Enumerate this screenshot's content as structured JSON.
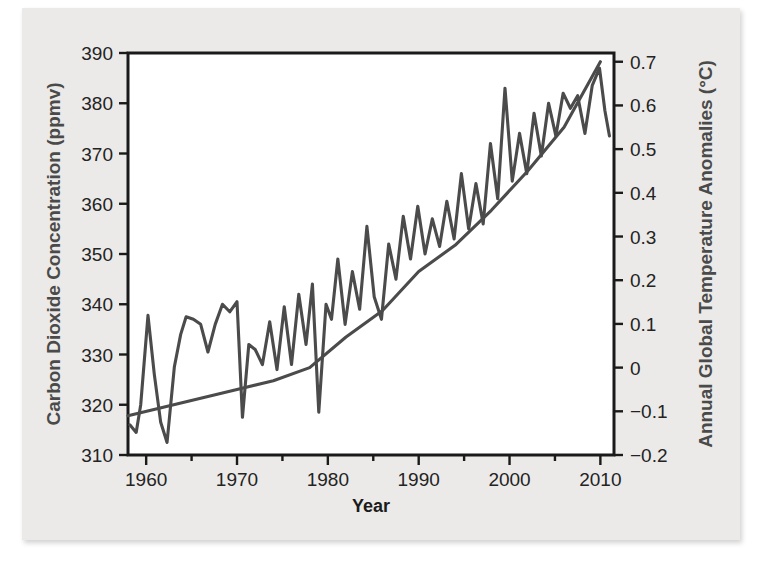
{
  "figure": {
    "background_color": "#ebeae8",
    "plot_background_color": "#ffffff",
    "line_color": "#4b4b4b",
    "axis_color": "#1a1a1a",
    "axis_title_color": "#4a4a4a"
  },
  "chart_data": {
    "type": "line",
    "title": "",
    "xlabel": "Year",
    "ylabel": "Carbon Dioxide Concentration (ppmv)",
    "y2label": "Annual Global Temperature Anomalies (°C)",
    "xlim": [
      1958,
      2011.5
    ],
    "ylim": [
      310,
      390
    ],
    "y2lim": [
      -0.2,
      0.72
    ],
    "grid": false,
    "legend": null,
    "xticks": [
      1960,
      1970,
      1980,
      1990,
      2000,
      2010
    ],
    "xtick_labels": [
      "1960",
      "1970",
      "1980",
      "1990",
      "2000",
      "2010"
    ],
    "xminor_ticks": [
      1965,
      1975,
      1985,
      1995,
      2005
    ],
    "yticks": [
      310,
      320,
      330,
      340,
      350,
      360,
      370,
      380,
      390
    ],
    "ytick_labels": [
      "310",
      "320",
      "330",
      "340",
      "350",
      "360",
      "370",
      "380",
      "390"
    ],
    "y2ticks": [
      -0.2,
      -0.1,
      0,
      0.1,
      0.2,
      0.3,
      0.4,
      0.5,
      0.6,
      0.7
    ],
    "y2tick_labels": [
      "−0.2",
      "−0.1",
      "0",
      "0.1",
      "0.2",
      "0.3",
      "0.4",
      "0.5",
      "0.6",
      "0.7"
    ],
    "series": [
      {
        "name": "Carbon Dioxide Concentration",
        "axis": "left",
        "units": "ppmv",
        "x": [
          1958.2,
          1958.9,
          1959.4,
          1960.2,
          1960.9,
          1961.6,
          1962.3,
          1963.1,
          1963.8,
          1964.4,
          1965.2,
          1966.0,
          1966.8,
          1967.6,
          1968.4,
          1969.2,
          1970.0,
          1970.6,
          1971.3,
          1972.0,
          1972.8,
          1973.6,
          1974.4,
          1975.2,
          1976.0,
          1976.8,
          1977.6,
          1978.3,
          1979.0,
          1979.8,
          1980.4,
          1981.1,
          1981.9,
          1982.7,
          1983.5,
          1984.3,
          1985.1,
          1985.9,
          1986.7,
          1987.5,
          1988.3,
          1989.1,
          1989.9,
          1990.7,
          1991.5,
          1992.3,
          1993.1,
          1993.9,
          1994.7,
          1995.5,
          1996.3,
          1997.1,
          1997.9,
          1998.7,
          1999.5,
          2000.3,
          2001.1,
          2001.9,
          2002.7,
          2003.5,
          2004.3,
          2005.1,
          2005.9,
          2006.7,
          2007.5,
          2008.3,
          2009.1,
          2009.9,
          2010.5,
          2011.0
        ],
        "y": [
          316.0,
          314.5,
          320.0,
          337.8,
          326.0,
          316.5,
          312.5,
          327.5,
          334.0,
          337.5,
          337.0,
          336.0,
          330.5,
          336.0,
          340.0,
          338.5,
          340.5,
          317.5,
          332.0,
          331.0,
          328.0,
          336.5,
          327.0,
          339.5,
          328.0,
          342.0,
          332.0,
          344.0,
          318.5,
          340.0,
          337.0,
          349.0,
          336.0,
          346.5,
          339.0,
          355.5,
          341.5,
          337.0,
          352.0,
          345.0,
          357.5,
          349.0,
          359.5,
          350.0,
          357.0,
          351.5,
          360.5,
          353.0,
          366.0,
          355.0,
          364.0,
          356.0,
          372.0,
          361.0,
          383.0,
          364.5,
          374.0,
          366.0,
          378.0,
          369.5,
          380.0,
          373.5,
          382.0,
          379.0,
          381.5,
          374.0,
          383.5,
          387.0,
          378.5,
          373.5
        ]
      },
      {
        "name": "Annual Global Temperature Anomalies",
        "axis": "right",
        "units": "°C",
        "x": [
          1958,
          1962,
          1966,
          1970,
          1974,
          1978,
          1982,
          1986,
          1990,
          1994,
          1998,
          2002,
          2006,
          2010
        ],
        "y": [
          -0.11,
          -0.09,
          -0.07,
          -0.05,
          -0.03,
          0.0,
          0.07,
          0.13,
          0.22,
          0.28,
          0.36,
          0.45,
          0.55,
          0.7
        ]
      }
    ]
  }
}
